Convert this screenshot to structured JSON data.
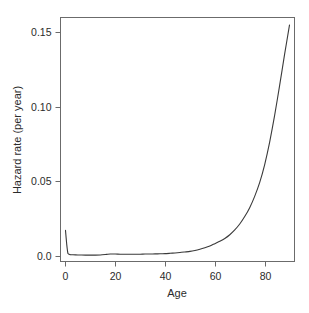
{
  "chart_data": {
    "type": "line",
    "title": "",
    "subtitle": "",
    "xlabel": "Age",
    "ylabel": "Hazard rate (per year)",
    "xlim": [
      -2,
      92
    ],
    "ylim": [
      -0.004,
      0.16
    ],
    "grid": false,
    "legend": false,
    "legend_position": "none",
    "xticks": [
      0,
      20,
      40,
      60,
      80
    ],
    "xticklabels": [
      "0",
      "20",
      "40",
      "60",
      "80"
    ],
    "yticks": [
      0.0,
      0.05,
      0.1,
      0.15
    ],
    "yticklabels": [
      "0.0",
      "0.05",
      "0.10",
      "0.15"
    ],
    "series": [
      {
        "name": "Hazard rate",
        "color": "#3a3a3a",
        "x": [
          0,
          0.5,
          1,
          2,
          3,
          5,
          8,
          10,
          12,
          14,
          16,
          17,
          18,
          19,
          20,
          22,
          24,
          26,
          28,
          30,
          32,
          34,
          36,
          38,
          40,
          42,
          44,
          46,
          48,
          50,
          52,
          54,
          56,
          58,
          60,
          62,
          64,
          66,
          68,
          70,
          72,
          74,
          76,
          78,
          80,
          82,
          84,
          86,
          88,
          90
        ],
        "y": [
          0.017,
          0.0075,
          0.0014,
          0.0006,
          0.0005,
          0.0004,
          0.0003,
          0.0003,
          0.0003,
          0.0004,
          0.0007,
          0.0009,
          0.001,
          0.001,
          0.001,
          0.0009,
          0.0009,
          0.0009,
          0.0009,
          0.0009,
          0.001,
          0.001,
          0.0011,
          0.0012,
          0.0013,
          0.0015,
          0.0017,
          0.002,
          0.0024,
          0.0028,
          0.0034,
          0.0042,
          0.0052,
          0.0064,
          0.008,
          0.0096,
          0.0115,
          0.014,
          0.0172,
          0.0212,
          0.0262,
          0.0322,
          0.0398,
          0.049,
          0.061,
          0.076,
          0.094,
          0.114,
          0.135,
          0.155
        ]
      }
    ]
  },
  "axes": {
    "y_title": "Hazard rate (per year)",
    "x_title": "Age"
  }
}
